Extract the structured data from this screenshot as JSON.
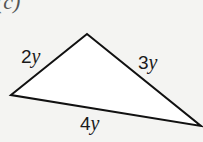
{
  "part_label": "(c)",
  "triangle": {
    "vertices": [
      [
        11,
        95
      ],
      [
        87,
        34
      ],
      [
        201,
        126
      ]
    ],
    "fill": "#ffffff",
    "stroke": "#111111",
    "sides": [
      {
        "coef": "2",
        "var": "y"
      },
      {
        "coef": "3",
        "var": "y"
      },
      {
        "coef": "4",
        "var": "y"
      }
    ]
  }
}
